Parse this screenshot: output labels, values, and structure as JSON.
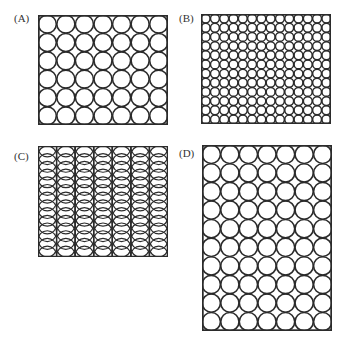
{
  "figure": {
    "stroke_color": "#2b2b2b",
    "background": "#ffffff",
    "panels": [
      {
        "label": "(A)",
        "label_pos": [
          14,
          13
        ],
        "box": [
          38,
          15,
          130,
          110
        ],
        "layout": "grid",
        "cols": 7,
        "rows": 6,
        "stroke_width": 1.6
      },
      {
        "label": "(B)",
        "label_pos": [
          179,
          13
        ],
        "box": [
          201,
          14,
          130,
          110
        ],
        "layout": "grid",
        "cols": 14,
        "rows": 12,
        "stroke_width": 1.5
      },
      {
        "label": "(C)",
        "label_pos": [
          14,
          151
        ],
        "box": [
          38,
          146,
          130,
          111
        ],
        "layout": "overlapping-columns",
        "cols": 7,
        "rows": 13,
        "stroke_width": 1.2
      },
      {
        "label": "(D)",
        "label_pos": [
          179,
          148
        ],
        "box": [
          202,
          145,
          130,
          186
        ],
        "layout": "grid",
        "cols": 7,
        "rows": 10,
        "stroke_width": 1.6
      }
    ]
  }
}
